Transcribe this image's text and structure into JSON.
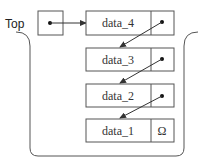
{
  "diagram": {
    "type": "linked-stack",
    "top_label": "Top",
    "nodes": [
      {
        "data": "data_4",
        "next": "pointer"
      },
      {
        "data": "data_3",
        "next": "pointer"
      },
      {
        "data": "data_2",
        "next": "pointer"
      },
      {
        "data": "data_1",
        "next": "Ω"
      }
    ],
    "null_symbol": "Ω",
    "colors": {
      "stroke": "#444444",
      "text": "#333333",
      "background": "#ffffff"
    }
  }
}
